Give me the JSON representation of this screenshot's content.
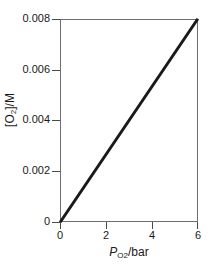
{
  "chart_data": {
    "type": "line",
    "title": "",
    "subtitle": "",
    "xlabel": "PO2/bar",
    "ylabel": "[O2]/M",
    "xlabel_parts": {
      "italic": "P",
      "sub": "O",
      "sub2": "2",
      "rest": "/bar"
    },
    "ylabel_parts": {
      "lead": "[O",
      "sub": "2",
      "rest": "]/M"
    },
    "xlim": [
      0,
      6
    ],
    "ylim": [
      0,
      0.008
    ],
    "xticks": [
      0,
      2,
      4,
      6
    ],
    "xticklabels": [
      "0",
      "2",
      "4",
      "6"
    ],
    "yticks": [
      0,
      0.002,
      0.004,
      0.006,
      0.008
    ],
    "yticklabels": [
      "0",
      "0.002",
      "0.004",
      "0.006",
      "0.008"
    ],
    "grid": false,
    "legend": false,
    "legend_position": "none",
    "series": [
      {
        "name": "Henry's law line",
        "x": [
          0,
          6
        ],
        "y": [
          0,
          0.008
        ],
        "color": "#1a1a1a",
        "linewidth": 3,
        "slope": 0.0013333,
        "intercept": 0
      }
    ],
    "annotations": []
  },
  "figure": {
    "background_color": "#ffffff",
    "frame_color": "#6e6e6e",
    "tick_color": "#4a4a4a",
    "text_color": "#1a1a1a"
  }
}
